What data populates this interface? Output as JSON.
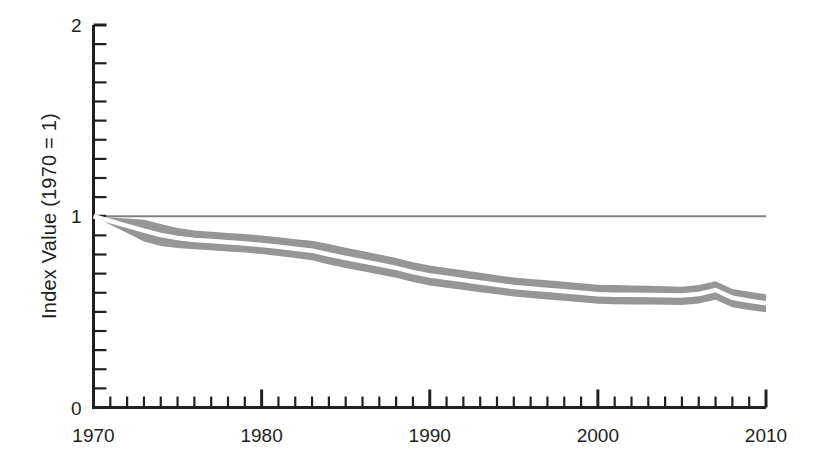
{
  "chart_data": {
    "type": "area",
    "title": "",
    "subtitle": "",
    "xlabel": "",
    "ylabel": "Index Value (1970 = 1)",
    "xlim": [
      1970,
      2010
    ],
    "ylim": [
      0,
      2
    ],
    "grid": false,
    "legend_position": "none",
    "annotations": [],
    "reference_lines": [
      {
        "axis": "y",
        "value": 1,
        "label": "",
        "color": "#808080"
      }
    ],
    "x_tick_labels": [
      "1970",
      "1980",
      "1990",
      "2000",
      "2010"
    ],
    "x_major_ticks": [
      1970,
      1980,
      1990,
      2000,
      2010
    ],
    "x_minor_tick_step": 1,
    "y_tick_labels": [
      "0",
      "1",
      "2"
    ],
    "y_major_ticks": [
      0,
      1,
      2
    ],
    "y_minor_tick_step": 0.1,
    "band_color": "#969696",
    "center_line_color": "#ffffff",
    "axis_color": "#231f20",
    "x": [
      1970,
      1971,
      1972,
      1973,
      1974,
      1975,
      1976,
      1977,
      1978,
      1979,
      1980,
      1981,
      1982,
      1983,
      1984,
      1985,
      1986,
      1987,
      1988,
      1989,
      1990,
      1991,
      1992,
      1993,
      1994,
      1995,
      1996,
      1997,
      1998,
      1999,
      2000,
      2001,
      2002,
      2003,
      2004,
      2005,
      2006,
      2007,
      2008,
      2009,
      2010
    ],
    "series": [
      {
        "name": "Upper bound",
        "values": [
          1.0,
          0.994,
          0.988,
          0.982,
          0.96,
          0.938,
          0.925,
          0.919,
          0.913,
          0.907,
          0.9,
          0.89,
          0.88,
          0.872,
          0.855,
          0.835,
          0.818,
          0.8,
          0.782,
          0.76,
          0.742,
          0.73,
          0.718,
          0.705,
          0.692,
          0.68,
          0.672,
          0.665,
          0.658,
          0.65,
          0.642,
          0.64,
          0.638,
          0.636,
          0.634,
          0.632,
          0.64,
          0.66,
          0.62,
          0.605,
          0.592
        ]
      },
      {
        "name": "Central estimate",
        "values": [
          1.0,
          0.975,
          0.95,
          0.925,
          0.902,
          0.886,
          0.876,
          0.87,
          0.864,
          0.858,
          0.85,
          0.84,
          0.83,
          0.82,
          0.8,
          0.782,
          0.765,
          0.748,
          0.73,
          0.708,
          0.69,
          0.678,
          0.666,
          0.654,
          0.642,
          0.63,
          0.622,
          0.615,
          0.608,
          0.6,
          0.592,
          0.59,
          0.589,
          0.588,
          0.587,
          0.586,
          0.594,
          0.614,
          0.574,
          0.558,
          0.545
        ]
      },
      {
        "name": "Lower bound",
        "values": [
          1.0,
          0.956,
          0.912,
          0.868,
          0.845,
          0.834,
          0.828,
          0.822,
          0.816,
          0.81,
          0.802,
          0.792,
          0.782,
          0.77,
          0.748,
          0.73,
          0.712,
          0.696,
          0.678,
          0.656,
          0.638,
          0.626,
          0.614,
          0.602,
          0.592,
          0.58,
          0.572,
          0.565,
          0.558,
          0.55,
          0.542,
          0.54,
          0.539,
          0.538,
          0.537,
          0.536,
          0.544,
          0.564,
          0.524,
          0.51,
          0.498
        ]
      }
    ]
  },
  "axis": {
    "y_label": "Index Value (1970 = 1)"
  }
}
